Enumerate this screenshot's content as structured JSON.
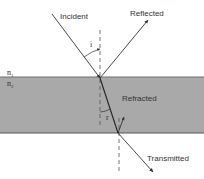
{
  "diagram": {
    "labels": {
      "incident": "Incident",
      "reflected": "Reflected",
      "refracted": "Refracted",
      "transmitted": "Transmitted",
      "n1": "n",
      "n1_sub": "1",
      "n2": "n",
      "n2_sub": "2",
      "angle_incidence": "i",
      "angle_refraction": "r"
    },
    "colors": {
      "slab": "#a9a9a9",
      "slab_edge": "#6e6e6e",
      "ray": "#333333",
      "normal": "#555555",
      "background": "#ffffff"
    }
  }
}
